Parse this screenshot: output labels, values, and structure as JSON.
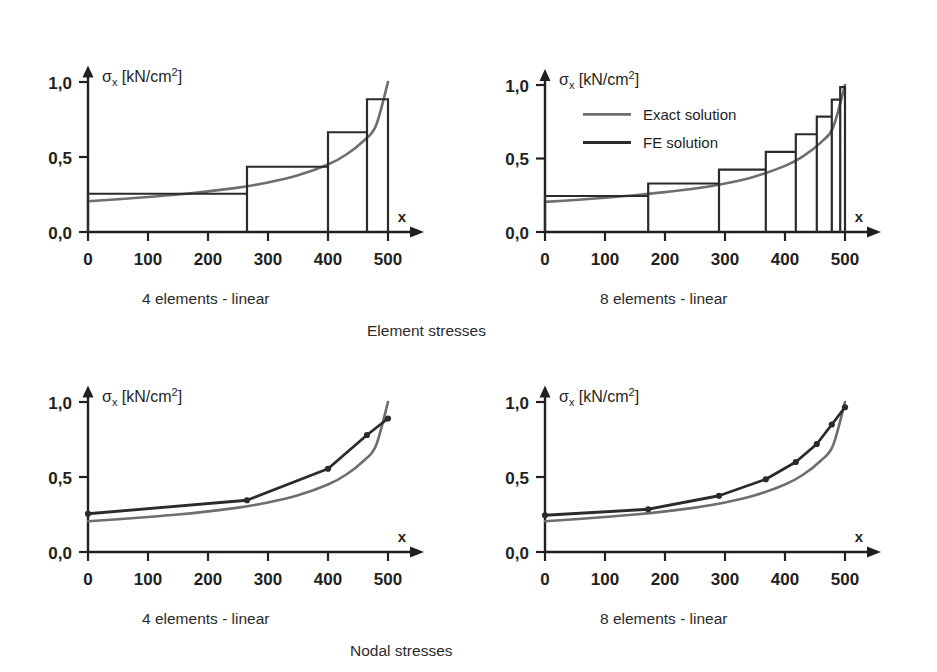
{
  "figure": {
    "background": "#ffffff",
    "ink_color": "#231f20",
    "exact_color": "#6d6e71",
    "fe_color": "#2b2b2b"
  },
  "legend": {
    "position": "top-left-inside-upper-right-plot",
    "entries": [
      {
        "label": "Exact solution",
        "color": "#6d6e71"
      },
      {
        "label": "FE solution",
        "color": "#2b2b2b"
      }
    ]
  },
  "group_captions": [
    {
      "text": "Element stresses",
      "x": 367,
      "y": 322
    },
    {
      "text": "Nodal stresses",
      "x": 350,
      "y": 642
    }
  ],
  "chart_data": [
    {
      "id": "element-stresses-4-elements",
      "type": "bar",
      "title": "4 elements - linear",
      "caption": "4 elements - linear",
      "group": "Element stresses",
      "xlabel": "x",
      "ylabel": "σx [kN/cm2]",
      "ylabel_parts": {
        "sigma": "σ",
        "sub": "x",
        "unit": "[kN/cm",
        "sup": "2",
        "close": "]"
      },
      "xlim": [
        0,
        560
      ],
      "ylim": [
        0,
        1.15
      ],
      "xticks": [
        0,
        100,
        200,
        300,
        400,
        500
      ],
      "xticklabels": [
        "0",
        "100",
        "200",
        "300",
        "400",
        "500"
      ],
      "yticks": [
        0.0,
        0.5,
        1.0
      ],
      "yticklabels": [
        "0,0",
        "0,5",
        "1,0"
      ],
      "grid": false,
      "element_edges": [
        0,
        265,
        400,
        465,
        500
      ],
      "values": [
        0.255,
        0.435,
        0.665,
        0.885
      ],
      "exact_curve": {
        "name": "Exact solution",
        "x": [
          0,
          50,
          100,
          150,
          200,
          250,
          300,
          350,
          400,
          430,
          460,
          480,
          500
        ],
        "y": [
          0.205,
          0.218,
          0.233,
          0.25,
          0.271,
          0.296,
          0.33,
          0.378,
          0.45,
          0.515,
          0.61,
          0.71,
          1.0
        ]
      }
    },
    {
      "id": "element-stresses-8-elements",
      "type": "bar",
      "title": "8 elements - linear",
      "caption": "8 elements - linear",
      "group": "Element stresses",
      "xlabel": "x",
      "ylabel": "σx [kN/cm2]",
      "ylabel_parts": {
        "sigma": "σ",
        "sub": "x",
        "unit": "[kN/cm",
        "sup": "2",
        "close": "]"
      },
      "xlim": [
        0,
        560
      ],
      "ylim": [
        0,
        1.15
      ],
      "xticks": [
        0,
        100,
        200,
        300,
        400,
        500
      ],
      "xticklabels": [
        "0",
        "100",
        "200",
        "300",
        "400",
        "500"
      ],
      "yticks": [
        0.0,
        0.5,
        1.0
      ],
      "yticklabels": [
        "0,0",
        "0,5",
        "1,0"
      ],
      "grid": false,
      "element_edges": [
        0,
        172,
        290,
        368,
        418,
        453,
        478,
        492,
        500
      ],
      "values": [
        0.245,
        0.33,
        0.425,
        0.545,
        0.665,
        0.785,
        0.9,
        0.985
      ],
      "exact_curve": {
        "name": "Exact solution",
        "x": [
          0,
          50,
          100,
          150,
          200,
          250,
          300,
          350,
          400,
          430,
          460,
          480,
          500
        ],
        "y": [
          0.205,
          0.218,
          0.233,
          0.25,
          0.271,
          0.296,
          0.33,
          0.378,
          0.45,
          0.515,
          0.61,
          0.71,
          1.0
        ]
      }
    },
    {
      "id": "nodal-stresses-4-elements",
      "type": "line",
      "title": "4 elements - linear",
      "caption": "4 elements - linear",
      "group": "Nodal stresses",
      "xlabel": "x",
      "ylabel": "σx [kN/cm2]",
      "ylabel_parts": {
        "sigma": "σ",
        "sub": "x",
        "unit": "[kN/cm",
        "sup": "2",
        "close": "]"
      },
      "xlim": [
        0,
        560
      ],
      "ylim": [
        0,
        1.15
      ],
      "xticks": [
        0,
        100,
        200,
        300,
        400,
        500
      ],
      "xticklabels": [
        "0",
        "100",
        "200",
        "300",
        "400",
        "500"
      ],
      "yticks": [
        0.0,
        0.5,
        1.0
      ],
      "yticklabels": [
        "0,0",
        "0,5",
        "1,0"
      ],
      "grid": false,
      "nodes_x": [
        0,
        265,
        400,
        465,
        500
      ],
      "nodes_y": [
        0.255,
        0.345,
        0.555,
        0.78,
        0.89
      ],
      "exact_curve": {
        "name": "Exact solution",
        "x": [
          0,
          50,
          100,
          150,
          200,
          250,
          300,
          350,
          400,
          430,
          460,
          480,
          500
        ],
        "y": [
          0.205,
          0.218,
          0.233,
          0.25,
          0.271,
          0.296,
          0.33,
          0.378,
          0.45,
          0.515,
          0.61,
          0.71,
          1.0
        ]
      }
    },
    {
      "id": "nodal-stresses-8-elements",
      "type": "line",
      "title": "8 elements - linear",
      "caption": "8 elements - linear",
      "group": "Nodal stresses",
      "xlabel": "x",
      "ylabel": "σx [kN/cm2]",
      "ylabel_parts": {
        "sigma": "σ",
        "sub": "x",
        "unit": "[kN/cm",
        "sup": "2",
        "close": "]"
      },
      "xlim": [
        0,
        560
      ],
      "ylim": [
        0,
        1.15
      ],
      "xticks": [
        0,
        100,
        200,
        300,
        400,
        500
      ],
      "xticklabels": [
        "0",
        "100",
        "200",
        "300",
        "400",
        "500"
      ],
      "yticks": [
        0.0,
        0.5,
        1.0
      ],
      "yticklabels": [
        "0,0",
        "0,5",
        "1,0"
      ],
      "grid": false,
      "nodes_x": [
        0,
        172,
        290,
        368,
        418,
        453,
        478,
        500
      ],
      "nodes_y": [
        0.245,
        0.285,
        0.375,
        0.485,
        0.6,
        0.72,
        0.85,
        0.965
      ],
      "exact_curve": {
        "name": "Exact solution",
        "x": [
          0,
          50,
          100,
          150,
          200,
          250,
          300,
          350,
          400,
          430,
          460,
          480,
          500
        ],
        "y": [
          0.205,
          0.218,
          0.233,
          0.25,
          0.271,
          0.296,
          0.33,
          0.378,
          0.45,
          0.515,
          0.61,
          0.71,
          1.0
        ]
      }
    }
  ],
  "plot_frames": [
    {
      "id": "element-stresses-4-elements",
      "ox": 88,
      "oy": 232,
      "x_per_unit": 0.6,
      "y_per_unit": 150,
      "caption_x": 142,
      "caption_y": 290,
      "legend": false
    },
    {
      "id": "element-stresses-8-elements",
      "ox": 545,
      "oy": 232,
      "x_per_unit": 0.6,
      "y_per_unit": 147,
      "caption_x": 600,
      "caption_y": 290,
      "legend": true
    },
    {
      "id": "nodal-stresses-4-elements",
      "ox": 88,
      "oy": 552,
      "x_per_unit": 0.6,
      "y_per_unit": 150,
      "caption_x": 142,
      "caption_y": 610,
      "legend": false
    },
    {
      "id": "nodal-stresses-8-elements",
      "ox": 545,
      "oy": 552,
      "x_per_unit": 0.6,
      "y_per_unit": 150,
      "caption_x": 600,
      "caption_y": 610,
      "legend": false
    }
  ]
}
